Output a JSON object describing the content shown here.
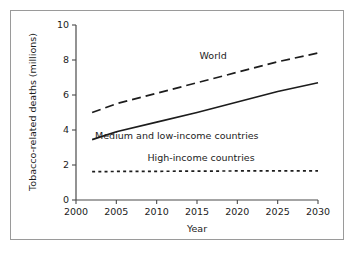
{
  "chart_data": {
    "type": "line",
    "title": "",
    "xlabel": "Year",
    "ylabel": "Tobacco-related deaths (millions)",
    "xlim": [
      2000,
      2030
    ],
    "ylim": [
      0,
      10
    ],
    "xticks": [
      2000,
      2005,
      2010,
      2015,
      2020,
      2025,
      2030
    ],
    "xtick_labels": [
      "2000",
      "2005",
      "2010",
      "2015",
      "2020",
      "2025",
      "2030"
    ],
    "yticks": [
      0,
      2,
      4,
      6,
      8,
      10
    ],
    "ytick_labels": [
      "0",
      "2",
      "4",
      "6",
      "8",
      "10"
    ],
    "grid": false,
    "legend": "inline-annotations",
    "x": [
      2002,
      2005,
      2010,
      2015,
      2020,
      2025,
      2030
    ],
    "series": [
      {
        "name": "World",
        "label": "World",
        "style": "long-dashed",
        "color": "#1c1c1c",
        "values": [
          5.0,
          5.5,
          6.1,
          6.7,
          7.3,
          7.9,
          8.4
        ]
      },
      {
        "name": "Medium and low-income countries",
        "label": "Medium and low-income countries",
        "style": "solid",
        "color": "#1c1c1c",
        "values": [
          3.45,
          3.9,
          4.45,
          5.0,
          5.6,
          6.2,
          6.7
        ]
      },
      {
        "name": "High-income countries",
        "label": "High-income countries",
        "style": "short-dashed",
        "color": "#1c1c1c",
        "values": [
          1.62,
          1.63,
          1.64,
          1.65,
          1.66,
          1.66,
          1.67
        ]
      }
    ],
    "annotations": [
      {
        "text": "World",
        "x": 2017,
        "y": 8.05
      },
      {
        "text": "Medium and low-income countries",
        "x": 2012.5,
        "y": 3.5
      },
      {
        "text": "High-income countries",
        "x": 2015.5,
        "y": 2.25
      }
    ]
  },
  "frame": {
    "border_color": "#9a9a9a"
  }
}
